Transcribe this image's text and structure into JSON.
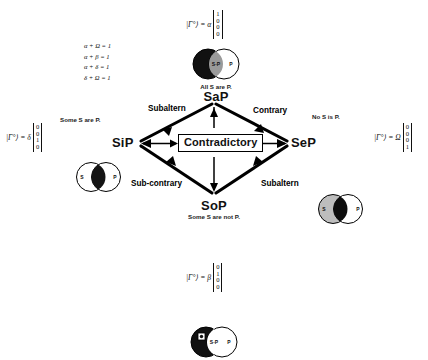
{
  "figure": {
    "background_color": "#ffffff",
    "line_color": "#000000"
  },
  "equations": {
    "lines": [
      "α + Ω = 1",
      "α + β = 1",
      "α + δ = 1",
      "δ + Ω = 1"
    ]
  },
  "corners": {
    "top": {
      "code": "SaP",
      "proposition": "All S are P.",
      "ket_lead": "|Γ°⟩ = α",
      "vector": [
        "1",
        "0",
        "0",
        "0"
      ],
      "venn": {
        "left_circle_label": "S",
        "right_circle_label": "P",
        "left_fill": "#111111",
        "right_fill": "#ffffff",
        "lens_fill": "#9a9a9a",
        "lens_text": "S·P"
      }
    },
    "left": {
      "code": "SiP",
      "proposition": "Some S are P.",
      "ket_lead": "|Γ°⟩ = δ",
      "vector": [
        "0",
        "0",
        "1",
        "0"
      ],
      "venn": {
        "left_circle_label": "S",
        "right_circle_label": "P",
        "left_fill": "#ffffff",
        "right_fill": "#ffffff",
        "lens_fill": "#141414",
        "lens_text": ""
      }
    },
    "right": {
      "code": "SeP",
      "proposition": "No S is P.",
      "ket_lead": "|Γ°⟩ = Ω",
      "vector": [
        "0",
        "0",
        "0",
        "1"
      ],
      "venn": {
        "left_circle_label": "S",
        "right_circle_label": "P",
        "left_fill": "#bdbdbd",
        "right_fill": "#ffffff",
        "lens_fill": "#0d0d0d",
        "lens_text": ""
      }
    },
    "bottom": {
      "code": "SoP",
      "proposition": "Some S are not P.",
      "ket_lead": "|Γ°⟩ = β",
      "vector": [
        "0",
        "1",
        "0",
        "0"
      ],
      "venn": {
        "left_circle_label": "",
        "right_circle_label": "P",
        "left_fill": "#111111",
        "right_fill": "#ffffff",
        "lens_fill": "#ffffff",
        "lens_text": "S·P"
      }
    }
  },
  "relations": {
    "center": "Contradictory",
    "top_left": "Subaltern",
    "top_right": "Contrary",
    "bottom_left": "Sub-contrary",
    "bottom_right": "Subaltern"
  }
}
